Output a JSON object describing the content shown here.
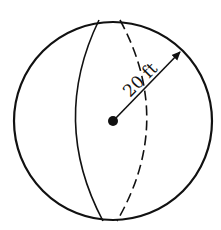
{
  "diagram": {
    "type": "sphere",
    "radius_label": "20 ft",
    "colors": {
      "stroke": "#111111",
      "background": "#ffffff"
    }
  }
}
